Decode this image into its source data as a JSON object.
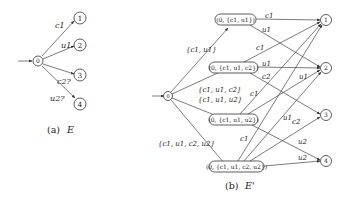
{
  "diagram_a": {
    "caption_prefix": "(a)",
    "caption_name": "E",
    "states": [
      {
        "id": "0",
        "label": "0",
        "initial": true
      },
      {
        "id": "1",
        "label": "1"
      },
      {
        "id": "2",
        "label": "2"
      },
      {
        "id": "3",
        "label": "3"
      },
      {
        "id": "4",
        "label": "4"
      }
    ],
    "edges": [
      {
        "from": "0",
        "to": "1",
        "label": "c1"
      },
      {
        "from": "0",
        "to": "2",
        "label": "u1"
      },
      {
        "from": "0",
        "to": "3",
        "label": "c2?"
      },
      {
        "from": "0",
        "to": "4",
        "label": "u2?"
      }
    ]
  },
  "diagram_b": {
    "caption_prefix": "(b)",
    "caption_name": "E'",
    "initial_state": "0",
    "macro_states": [
      {
        "id": "A",
        "label": "(0, {c1, u1})"
      },
      {
        "id": "B",
        "label": "(0, {c1, u1, c2})"
      },
      {
        "id": "C",
        "label": "(0, {c1, u1, u2})"
      },
      {
        "id": "D",
        "label": "(0, {c1, u1, c2, u2})"
      }
    ],
    "final_states": [
      "1",
      "2",
      "3",
      "4"
    ],
    "entry_edges": [
      {
        "to": "A",
        "label": "{c1, u1}"
      },
      {
        "to": "B",
        "label": "{c1, u1, c2}"
      },
      {
        "to": "C",
        "label": "{c1, u1, u2}"
      },
      {
        "to": "D",
        "label": "{c1, u1, c2, u2}"
      }
    ],
    "edges": [
      {
        "from": "A",
        "to": "1",
        "label": "c1"
      },
      {
        "from": "A",
        "to": "2",
        "label": "u1"
      },
      {
        "from": "B",
        "to": "1",
        "label": "c1"
      },
      {
        "from": "B",
        "to": "2",
        "label": "u1"
      },
      {
        "from": "B",
        "to": "3",
        "label": "c2"
      },
      {
        "from": "C",
        "to": "1",
        "label": "c1"
      },
      {
        "from": "C",
        "to": "2",
        "label": "u1"
      },
      {
        "from": "C",
        "to": "4",
        "label": "u2"
      },
      {
        "from": "D",
        "to": "1",
        "label": "c1"
      },
      {
        "from": "D",
        "to": "2",
        "label": "u1"
      },
      {
        "from": "D",
        "to": "3",
        "label": "c2"
      },
      {
        "from": "D",
        "to": "4",
        "label": "u2"
      }
    ]
  }
}
